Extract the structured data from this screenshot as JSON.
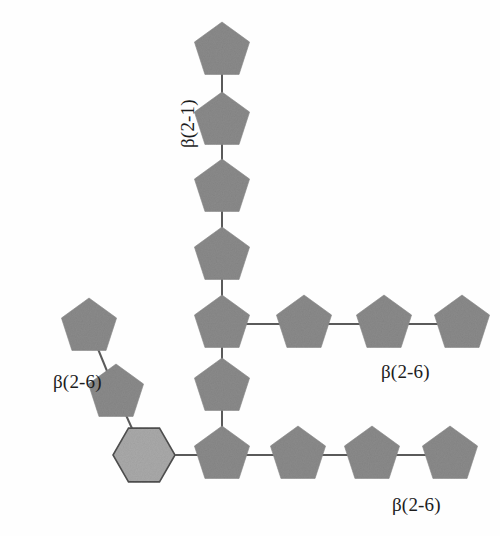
{
  "figure": {
    "type": "glycan-structure-diagram",
    "background_color": "#fefefe",
    "residue_fill_pentagon": "#8a8a8a",
    "residue_fill_hexagon": "#a9a9a9",
    "residue_stroke": "#6a6a6a",
    "bond_color": "#5a5a5a",
    "label_color": "#1c1c1c"
  },
  "labels": {
    "beta_2_1": "β(2-1)",
    "beta_2_6_upper": "β(2-6)",
    "beta_2_6_left": "β(2-6)",
    "beta_2_6_lower": "β(2-6)"
  },
  "chart_data": {
    "type": "diagram",
    "title": "",
    "residues": [
      {
        "id": "v1",
        "shape": "pentagon",
        "cx": 222,
        "cy": 51,
        "r": 29,
        "fill": "#8a8a8a",
        "chain": "vertical-backbone"
      },
      {
        "id": "v2",
        "shape": "pentagon",
        "cx": 222,
        "cy": 121,
        "r": 29,
        "fill": "#8a8a8a",
        "chain": "vertical-backbone"
      },
      {
        "id": "v3",
        "shape": "pentagon",
        "cx": 222,
        "cy": 188,
        "r": 29,
        "fill": "#8a8a8a",
        "chain": "vertical-backbone"
      },
      {
        "id": "v4",
        "shape": "pentagon",
        "cx": 222,
        "cy": 256,
        "r": 29,
        "fill": "#8a8a8a",
        "chain": "vertical-backbone"
      },
      {
        "id": "j1",
        "shape": "pentagon",
        "cx": 222,
        "cy": 324,
        "r": 29,
        "fill": "#8a8a8a",
        "chain": "junction-upper"
      },
      {
        "id": "h1a",
        "shape": "pentagon",
        "cx": 304,
        "cy": 324,
        "r": 29,
        "fill": "#8a8a8a",
        "chain": "upper-branch"
      },
      {
        "id": "h1b",
        "shape": "pentagon",
        "cx": 384,
        "cy": 324,
        "r": 29,
        "fill": "#8a8a8a",
        "chain": "upper-branch"
      },
      {
        "id": "h1c",
        "shape": "pentagon",
        "cx": 462,
        "cy": 324,
        "r": 29,
        "fill": "#8a8a8a",
        "chain": "upper-branch"
      },
      {
        "id": "v5",
        "shape": "pentagon",
        "cx": 222,
        "cy": 387,
        "r": 29,
        "fill": "#8a8a8a",
        "chain": "vertical-backbone"
      },
      {
        "id": "j2",
        "shape": "pentagon",
        "cx": 222,
        "cy": 455,
        "r": 29,
        "fill": "#8a8a8a",
        "chain": "junction-lower"
      },
      {
        "id": "h2a",
        "shape": "pentagon",
        "cx": 298,
        "cy": 455,
        "r": 29,
        "fill": "#8a8a8a",
        "chain": "lower-branch"
      },
      {
        "id": "h2b",
        "shape": "pentagon",
        "cx": 372,
        "cy": 455,
        "r": 29,
        "fill": "#8a8a8a",
        "chain": "lower-branch"
      },
      {
        "id": "h2c",
        "shape": "pentagon",
        "cx": 450,
        "cy": 455,
        "r": 29,
        "fill": "#8a8a8a",
        "chain": "lower-branch"
      },
      {
        "id": "hex",
        "shape": "hexagon",
        "cx": 144,
        "cy": 455,
        "r": 31,
        "fill": "#a9a9a9",
        "chain": "lower-branch"
      },
      {
        "id": "d1",
        "shape": "pentagon",
        "cx": 116,
        "cy": 393,
        "r": 29,
        "fill": "#8a8a8a",
        "chain": "diagonal-branch"
      },
      {
        "id": "d2",
        "shape": "pentagon",
        "cx": 89,
        "cy": 327,
        "r": 29,
        "fill": "#8a8a8a",
        "chain": "diagonal-branch"
      }
    ],
    "bonds": [
      {
        "from": "v1",
        "to": "v2"
      },
      {
        "from": "v2",
        "to": "v3"
      },
      {
        "from": "v3",
        "to": "v4"
      },
      {
        "from": "v4",
        "to": "j1"
      },
      {
        "from": "j1",
        "to": "h1a"
      },
      {
        "from": "h1a",
        "to": "h1b"
      },
      {
        "from": "h1b",
        "to": "h1c"
      },
      {
        "from": "j1",
        "to": "v5"
      },
      {
        "from": "v5",
        "to": "j2"
      },
      {
        "from": "j2",
        "to": "h2a"
      },
      {
        "from": "h2a",
        "to": "h2b"
      },
      {
        "from": "h2b",
        "to": "h2c"
      },
      {
        "from": "hex",
        "to": "j2"
      },
      {
        "from": "d1",
        "to": "hex"
      },
      {
        "from": "d2",
        "to": "d1"
      }
    ],
    "annotations": [
      {
        "text": "β(2-1)",
        "x": 178,
        "y": 148,
        "rotation": -90,
        "for_chain": "vertical-backbone"
      },
      {
        "text": "β(2-6)",
        "x": 381,
        "y": 362,
        "rotation": 0,
        "for_chain": "upper-branch"
      },
      {
        "text": "β(2-6)",
        "x": 53,
        "y": 372,
        "rotation": 0,
        "for_chain": "diagonal-branch"
      },
      {
        "text": "β(2-6)",
        "x": 392,
        "y": 495,
        "rotation": 0,
        "for_chain": "lower-branch"
      }
    ]
  }
}
